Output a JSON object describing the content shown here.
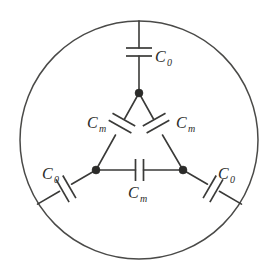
{
  "figure": {
    "type": "circuit-diagram",
    "background_color": "#ffffff",
    "line_color": "#3a3a38",
    "node_color": "#2b2b29"
  },
  "enclosure": {
    "name": "circular-boundary",
    "shape": "circle",
    "center_x": 139,
    "center_y": 140,
    "radius": 119
  },
  "nodes": [
    {
      "id": "apex",
      "label": "",
      "x": 139,
      "y": 93
    },
    {
      "id": "left",
      "label": "",
      "x": 96,
      "y": 170
    },
    {
      "id": "right",
      "label": "",
      "x": 183,
      "y": 170
    }
  ],
  "capacitors": [
    {
      "id": "c0-top",
      "symbol": "C",
      "subscript": "0",
      "label": "C0",
      "orientation": "vertical",
      "label_x": 157,
      "label_y": 60
    },
    {
      "id": "cm-left",
      "symbol": "C",
      "subscript": "m",
      "label": "Cm",
      "orientation": "diagonal-left",
      "label_x": 90,
      "label_y": 127
    },
    {
      "id": "cm-right",
      "symbol": "C",
      "subscript": "m",
      "label": "Cm",
      "orientation": "diagonal-right",
      "label_x": 176,
      "label_y": 127
    },
    {
      "id": "cm-bottom",
      "symbol": "C",
      "subscript": "m",
      "label": "Cm",
      "orientation": "horizontal",
      "label_x": 130,
      "label_y": 196
    },
    {
      "id": "c0-left",
      "symbol": "C",
      "subscript": "0",
      "label": "C0",
      "orientation": "diagonal-left-lower",
      "label_x": 44,
      "label_y": 177
    },
    {
      "id": "c0-right",
      "symbol": "C",
      "subscript": "0",
      "label": "C0",
      "orientation": "diagonal-right-lower",
      "label_x": 216,
      "label_y": 177
    }
  ],
  "labels": {
    "c0_top": "C",
    "c0_top_sub": "0",
    "cm_left": "C",
    "cm_left_sub": "m",
    "cm_right": "C",
    "cm_right_sub": "m",
    "cm_bottom": "C",
    "cm_bottom_sub": "m",
    "c0_left": "C",
    "c0_left_sub": "0",
    "c0_right": "C",
    "c0_right_sub": "0"
  }
}
